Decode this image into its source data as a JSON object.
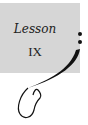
{
  "heading": {
    "label": "Lesson",
    "number": "IX"
  },
  "colors": {
    "panel": "#d6d6d6",
    "ink": "#111111"
  }
}
